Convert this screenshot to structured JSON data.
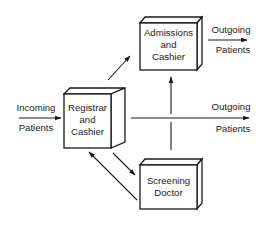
{
  "diagram": {
    "nodes": {
      "admissions": {
        "line1": "Admissions",
        "line2": "and",
        "line3": "Cashier"
      },
      "registrar": {
        "line1": "Registrar",
        "line2": "and",
        "line3": "Cashier"
      },
      "screening": {
        "line1": "Screening",
        "line2": "Doctor"
      }
    },
    "labels": {
      "incoming": {
        "line1": "Incoming",
        "line2": "Patients"
      },
      "outgoing_top": {
        "line1": "Outgoing",
        "line2": "Patients"
      },
      "outgoing_mid": {
        "line1": "Outgoing",
        "line2": "Patients"
      }
    },
    "edges": [
      {
        "from": "Incoming Patients",
        "to": "Registrar and Cashier"
      },
      {
        "from": "Registrar and Cashier",
        "to": "Admissions and Cashier"
      },
      {
        "from": "Registrar and Cashier",
        "to": "Outgoing Patients"
      },
      {
        "from": "Registrar and Cashier",
        "to": "Screening Doctor"
      },
      {
        "from": "Screening Doctor",
        "to": "Registrar and Cashier"
      },
      {
        "from": "Screening Doctor",
        "to": "Admissions and Cashier"
      },
      {
        "from": "Admissions and Cashier",
        "to": "Outgoing Patients"
      }
    ]
  }
}
